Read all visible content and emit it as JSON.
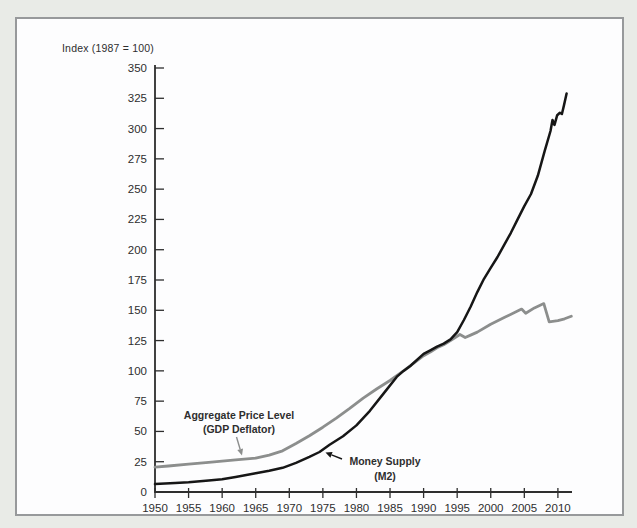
{
  "colors": {
    "page_bg": "#e9ebe7",
    "panel_bg": "#fdfdfe",
    "panel_border": "#97999b"
  },
  "chart_data": {
    "type": "line",
    "title": "",
    "ylabel": "Index (1987 = 100)",
    "xlabel": "",
    "grid": false,
    "legend_position": "inline-annotations",
    "axis_color": "#2e2e2e",
    "xlim": [
      1950,
      2012.1
    ],
    "ylim": [
      0,
      350
    ],
    "x_ticks": [
      1950,
      1955,
      1960,
      1965,
      1970,
      1975,
      1980,
      1985,
      1990,
      1995,
      2000,
      2005,
      2010
    ],
    "y_ticks": [
      0,
      25,
      50,
      75,
      100,
      125,
      150,
      175,
      200,
      225,
      250,
      275,
      300,
      325,
      350
    ],
    "series": [
      {
        "id": "price-level",
        "name": "Aggregate Price Level (GDP Deflator)",
        "color": "#8c8e8d",
        "width": 2.8,
        "points": [
          [
            1950,
            20.5
          ],
          [
            1952,
            21.5
          ],
          [
            1955,
            23
          ],
          [
            1958,
            24.5
          ],
          [
            1960,
            25.5
          ],
          [
            1962,
            26.5
          ],
          [
            1965,
            28
          ],
          [
            1967,
            30.5
          ],
          [
            1969,
            34
          ],
          [
            1971,
            40
          ],
          [
            1973,
            46.5
          ],
          [
            1975,
            53.5
          ],
          [
            1977,
            61
          ],
          [
            1979,
            69
          ],
          [
            1981,
            77.5
          ],
          [
            1983,
            85
          ],
          [
            1985,
            92
          ],
          [
            1987,
            100
          ],
          [
            1988,
            104
          ],
          [
            1990,
            112.5
          ],
          [
            1991,
            115.5
          ],
          [
            1992,
            119
          ],
          [
            1993,
            121.5
          ],
          [
            1994,
            125
          ],
          [
            1995.4,
            130
          ],
          [
            1996.2,
            127.5
          ],
          [
            1997,
            129.5
          ],
          [
            1998,
            132
          ],
          [
            2000,
            138.5
          ],
          [
            2002,
            144
          ],
          [
            2004.6,
            151
          ],
          [
            2005.2,
            147.5
          ],
          [
            2006.5,
            152
          ],
          [
            2007.9,
            155.5
          ],
          [
            2008.7,
            140.5
          ],
          [
            2010,
            141.5
          ],
          [
            2011,
            143
          ],
          [
            2012,
            145
          ]
        ]
      },
      {
        "id": "money-supply",
        "name": "Money Supply (M2)",
        "color": "#161616",
        "width": 2.5,
        "points": [
          [
            1950,
            6.5
          ],
          [
            1953,
            7.5
          ],
          [
            1955,
            8
          ],
          [
            1958,
            9.5
          ],
          [
            1960,
            10.5
          ],
          [
            1962,
            12.5
          ],
          [
            1965,
            15.5
          ],
          [
            1967,
            17.5
          ],
          [
            1969,
            20
          ],
          [
            1971,
            24
          ],
          [
            1973,
            29
          ],
          [
            1974.5,
            33
          ],
          [
            1976,
            39
          ],
          [
            1978,
            46
          ],
          [
            1980,
            55
          ],
          [
            1982,
            67
          ],
          [
            1984,
            81
          ],
          [
            1986,
            95
          ],
          [
            1987,
            100
          ],
          [
            1988,
            104
          ],
          [
            1990,
            114
          ],
          [
            1991,
            117
          ],
          [
            1992,
            120
          ],
          [
            1993,
            122.5
          ],
          [
            1994,
            126
          ],
          [
            1995,
            132
          ],
          [
            1996,
            142
          ],
          [
            1997,
            153
          ],
          [
            1998,
            165
          ],
          [
            1999,
            176
          ],
          [
            2000,
            185
          ],
          [
            2001,
            194
          ],
          [
            2002,
            204
          ],
          [
            2003,
            214
          ],
          [
            2004,
            225
          ],
          [
            2005,
            236
          ],
          [
            2006,
            246
          ],
          [
            2007,
            261
          ],
          [
            2008,
            281
          ],
          [
            2008.9,
            298
          ],
          [
            2009.2,
            307
          ],
          [
            2009.5,
            303
          ],
          [
            2009.9,
            311
          ],
          [
            2010.3,
            313
          ],
          [
            2010.6,
            312
          ],
          [
            2010.9,
            319
          ],
          [
            2011.3,
            329
          ]
        ]
      }
    ],
    "annotations": [
      {
        "name": "price-level-label",
        "lines": [
          "Aggregate Price Level",
          "(GDP Deflator)"
        ],
        "color": "#8c8e8d",
        "x": 239,
        "y": 419,
        "line_gap": 14,
        "arrow": [
          236.5,
          437,
          242,
          455.5
        ]
      },
      {
        "name": "m2-label",
        "lines": [
          "Money Supply",
          "(M2)"
        ],
        "color": "#161616",
        "x": 385,
        "y": 465,
        "line_gap": 15,
        "arrow": [
          342,
          459,
          325.5,
          452.5
        ]
      }
    ]
  }
}
